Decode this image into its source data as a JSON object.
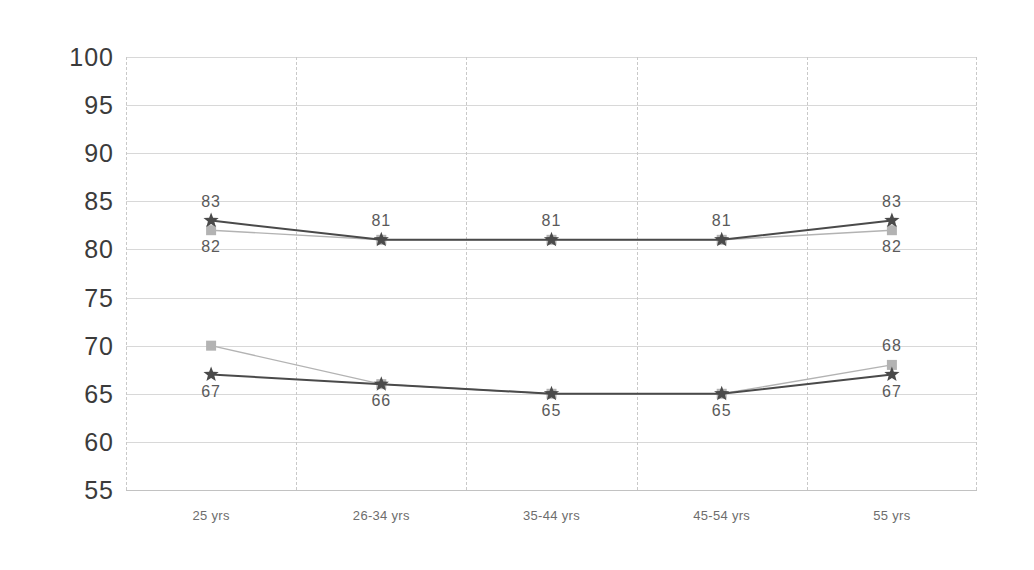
{
  "chart_data": {
    "type": "line",
    "title": "",
    "subtitle": "",
    "xlabel": "",
    "ylabel": "",
    "categories": [
      "25 yrs",
      "26-34 yrs",
      "35-44 yrs",
      "45-54 yrs",
      "55 yrs"
    ],
    "ylim": [
      55,
      100
    ],
    "yticks": [
      55,
      60,
      65,
      70,
      75,
      80,
      85,
      90,
      95,
      100
    ],
    "ytick_labels": [
      "55",
      "60",
      "65",
      "70",
      "75",
      "80",
      "85",
      "90",
      "95",
      "100"
    ],
    "grid": {
      "horizontal": true,
      "vertical": true,
      "vertical_style": "dashed"
    },
    "legend": {
      "visible": false,
      "position": "none"
    },
    "series": [
      {
        "name": "series-dark",
        "color": "#4a4a4a",
        "marker": "star",
        "values": [
          83,
          81,
          81,
          81,
          83
        ],
        "labels": [
          "83",
          "81",
          "81",
          "81",
          "83"
        ],
        "label_position": [
          "above",
          "above",
          "above",
          "above",
          "above"
        ]
      },
      {
        "name": "series-light",
        "color": "#b3b3b3",
        "marker": "square",
        "values": [
          82,
          81,
          81,
          81,
          82
        ],
        "labels": [
          "82",
          "",
          "",
          "",
          "82"
        ],
        "label_position": [
          "below",
          "none",
          "none",
          "none",
          "below"
        ]
      },
      {
        "name": "series-dark-lower",
        "color": "#4a4a4a",
        "marker": "star",
        "values": [
          67,
          66,
          65,
          65,
          67
        ],
        "labels": [
          "67",
          "66",
          "65",
          "65",
          "67"
        ],
        "label_position": [
          "below",
          "below",
          "below",
          "below",
          "below"
        ]
      },
      {
        "name": "series-light-lower",
        "color": "#b3b3b3",
        "marker": "square",
        "values": [
          70,
          66,
          65,
          65,
          68
        ],
        "labels": [
          "",
          "",
          "",
          "",
          "68"
        ],
        "label_position": [
          "none",
          "none",
          "none",
          "none",
          "above"
        ]
      }
    ]
  },
  "colors": {
    "dark_series": "#4a4a4a",
    "light_series": "#b3b3b3",
    "horizontal_grid": "#d8d8d8",
    "vertical_grid": "#c9c9c9",
    "y_tick_text": "#3b3b3b",
    "x_tick_text": "#6d6d6d",
    "point_label_text": "#5a5a5a",
    "background": "#ffffff"
  }
}
